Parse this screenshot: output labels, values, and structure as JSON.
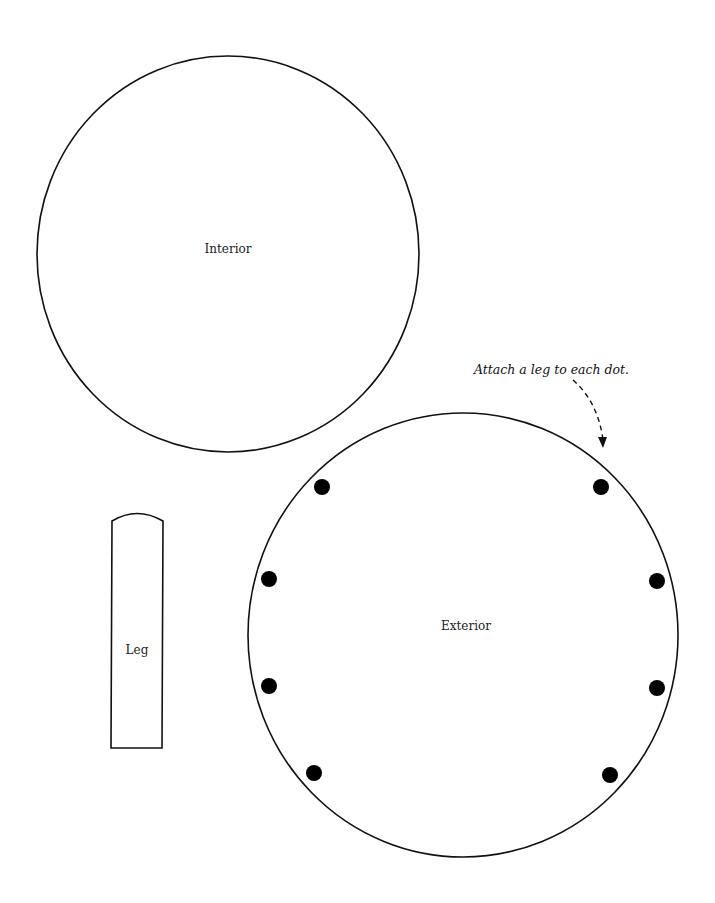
{
  "page": {
    "background": "#ffffff",
    "stroke_color": "#111111"
  },
  "interior": {
    "label": "Interior",
    "cx": 228,
    "cy": 254,
    "rx": 191,
    "ry": 198
  },
  "exterior": {
    "label": "Exterior",
    "cx": 463,
    "cy": 635,
    "rx": 215,
    "ry": 222,
    "dots": [
      {
        "x": 322,
        "y": 487
      },
      {
        "x": 601,
        "y": 487
      },
      {
        "x": 269,
        "y": 579
      },
      {
        "x": 657,
        "y": 581
      },
      {
        "x": 269,
        "y": 686
      },
      {
        "x": 657,
        "y": 688
      },
      {
        "x": 314,
        "y": 773
      },
      {
        "x": 610,
        "y": 775
      }
    ],
    "dot_radius": 8
  },
  "leg": {
    "label": "Leg"
  },
  "annotation": {
    "text": "Attach a leg to each dot."
  }
}
